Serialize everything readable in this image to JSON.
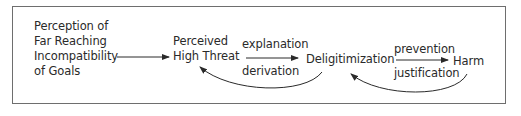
{
  "diagram": {
    "nodes": {
      "perception": {
        "line1": "Perception of",
        "line2": "Far Reaching",
        "line3": "Incompatibility",
        "line4": "of Goals"
      },
      "threat": {
        "line1": "Perceived",
        "line2": "High Threat"
      },
      "delegitimization": "Deligitimization",
      "harm": "Harm"
    },
    "edges": {
      "threat_to_deleg_label": "explanation",
      "deleg_to_threat_label": "derivation",
      "deleg_to_harm_label": "prevention",
      "harm_to_deleg_label": "justification"
    },
    "colors": {
      "line": "#2a2a2a",
      "frame": "#6e6e6e",
      "text": "#2a2a2a"
    }
  }
}
